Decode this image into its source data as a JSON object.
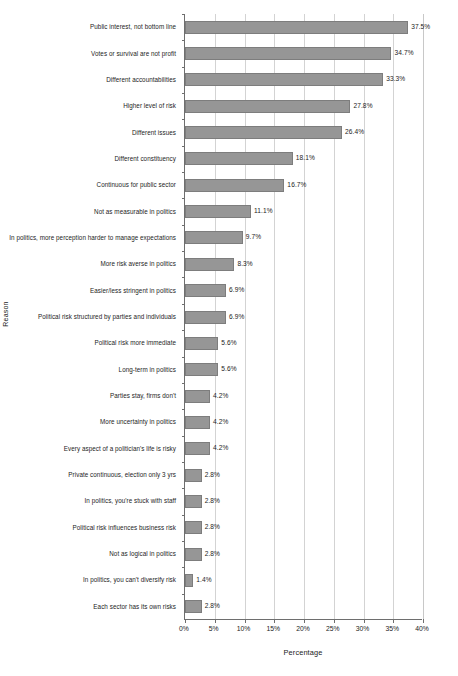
{
  "chart_data": {
    "type": "bar",
    "orientation": "horizontal",
    "title": "",
    "xlabel": "Percentage",
    "ylabel": "Reason",
    "xlim": [
      0,
      40
    ],
    "xtick_labels": [
      "0%",
      "5%",
      "10%",
      "15%",
      "20%",
      "25%",
      "30%",
      "35%",
      "40%"
    ],
    "xtick_values": [
      0,
      5,
      10,
      15,
      20,
      25,
      30,
      35,
      40
    ],
    "grid": "vertical",
    "legend": "none",
    "bar_color": "#969696",
    "bar_edge_color": "#7d7d7d",
    "axis_color": "#6e6e6e",
    "gridline_color": "#d3d3d3",
    "categories": [
      "Public interest, not bottom line",
      "Votes or survival are not profit",
      "Different accountabilities",
      "Higher level of risk",
      "Different issues",
      "Different constituency",
      "Continuous for public sector",
      "Not as measurable in politics",
      "In politics, more perception harder to manage expectations",
      "More risk averse in politics",
      "Easier/less stringent in politics",
      "Political risk structured by parties and individuals",
      "Political risk more immediate",
      "Long-term in politics",
      "Parties stay, firms don't",
      "More uncertainty in politics",
      "Every aspect of a politician's life is risky",
      "Private continuous, election only 3 yrs",
      "In politics, you're stuck with staff",
      "Political risk influences business risk",
      "Not as logical in politics",
      "In politics,  you can't diversify risk",
      "Each sector has its own risks"
    ],
    "values": [
      37.5,
      34.7,
      33.3,
      27.8,
      26.4,
      18.1,
      16.7,
      11.1,
      9.7,
      8.3,
      6.9,
      6.9,
      5.6,
      5.6,
      4.2,
      4.2,
      4.2,
      2.8,
      2.8,
      2.8,
      2.8,
      1.4,
      2.8
    ],
    "value_labels": [
      "37.5%",
      "34.7%",
      "33.3%",
      "27.8%",
      "26.4%",
      "18.1%",
      "16.7%",
      "11.1%",
      "9.7%",
      "8.3%",
      "6.9%",
      "6.9%",
      "5.6%",
      "5.6%",
      "4.2%",
      "4.2%",
      "4.2%",
      "2.8%",
      "2.8%",
      "2.8%",
      "2.8%",
      "1.4%",
      "2.8%"
    ]
  }
}
